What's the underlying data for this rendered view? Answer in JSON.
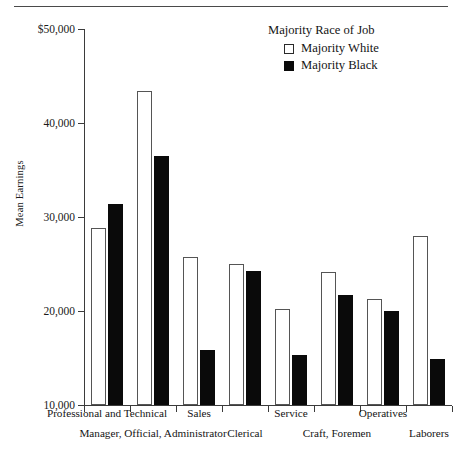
{
  "chart_data": {
    "type": "bar",
    "title": "",
    "xlabel": "",
    "ylabel": "Mean Earnings",
    "ylim": [
      10000,
      50000
    ],
    "yticks": [
      10000,
      20000,
      30000,
      40000,
      50000
    ],
    "ytick_labels": [
      "10,000",
      "20,000",
      "30,000",
      "40,000",
      "$50,000"
    ],
    "grid": false,
    "legend_position": "top-right",
    "legend_title": "Majority Race of Job",
    "categories": [
      "Professional and Technical",
      "Manager, Official, Administrator",
      "Sales",
      "Clerical",
      "Service",
      "Craft, Foremen",
      "Operatives",
      "Laborers"
    ],
    "series": [
      {
        "name": "Majority White",
        "color": "#ffffff",
        "values": [
          28800,
          43400,
          25700,
          25000,
          20200,
          24200,
          21300,
          28000
        ]
      },
      {
        "name": "Majority Black",
        "color": "#000000",
        "values": [
          31400,
          36500,
          15800,
          24300,
          15300,
          21700,
          20000,
          14900
        ]
      }
    ]
  },
  "axis": {
    "y_title": "Mean Earnings",
    "y_labels": [
      "$50,000",
      "40,000",
      "30,000",
      "20,000",
      "10,000"
    ]
  },
  "legend": {
    "title": "Majority Race of Job",
    "entries": [
      {
        "label": "Majority White",
        "swatch": "white-square-icon"
      },
      {
        "label": "Majority Black",
        "swatch": "black-square-icon"
      }
    ]
  },
  "x_labels_row1": [
    "Professional and Technical",
    "Sales",
    "Service",
    "Operatives"
  ],
  "x_labels_row2": [
    "Manager, Official, Administrator",
    "Clerical",
    "Craft, Foremen",
    "Laborers"
  ]
}
